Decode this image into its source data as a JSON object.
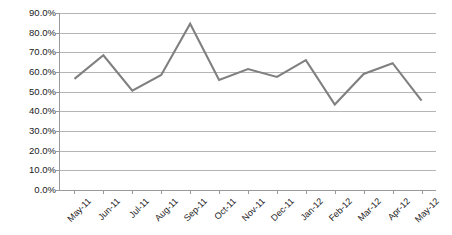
{
  "chart_data": {
    "type": "line",
    "title": "",
    "subtitle": "",
    "xlabel": "",
    "ylabel": "",
    "categories": [
      "May-11",
      "Jun-11",
      "Jul-11",
      "Aug-11",
      "Sep-11",
      "Oct-11",
      "Nov-11",
      "Dec-11",
      "Jan-12",
      "Feb-12",
      "Mar-12",
      "Apr-12",
      "May-12"
    ],
    "values": [
      56.5,
      68.5,
      50.5,
      58.5,
      84.5,
      56.0,
      61.5,
      57.5,
      66.0,
      43.5,
      59.0,
      64.5,
      45.5
    ],
    "series": [
      {
        "name": "Series 1",
        "values": [
          56.5,
          68.5,
          50.5,
          58.5,
          84.5,
          56.0,
          61.5,
          57.5,
          66.0,
          43.5,
          59.0,
          64.5,
          45.5
        ],
        "color": "#808080"
      }
    ],
    "ylim": [
      0,
      90
    ],
    "ytick_labels": [
      "90.0%",
      "80.0%",
      "70.0%",
      "60.0%",
      "50.0%",
      "40.0%",
      "30.0%",
      "20.0%",
      "10.0%",
      "0.0%"
    ],
    "ytick_values": [
      90,
      80,
      70,
      60,
      50,
      40,
      30,
      20,
      10,
      0
    ],
    "grid": true,
    "grid_axis": "y",
    "legend": false,
    "legend_position": "none",
    "markers": false,
    "colors": {
      "series": "#808080",
      "gridline": "#b5b5b5",
      "axis": "#9a9a9a",
      "text": "#222222",
      "background": "#ffffff"
    }
  }
}
